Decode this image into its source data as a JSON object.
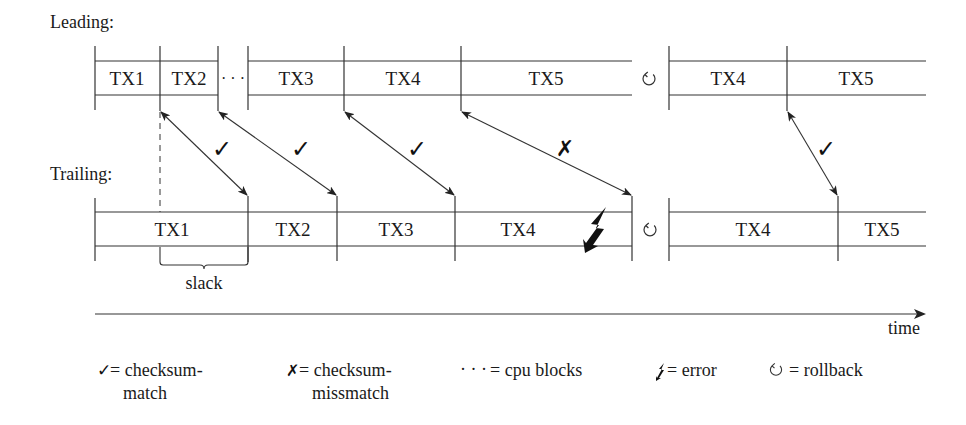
{
  "labels": {
    "leading": "Leading:",
    "trailing": "Trailing:",
    "slack": "slack",
    "time": "time",
    "cpu_blocks_dots": "· · ·"
  },
  "leading": {
    "segments": [
      {
        "label": "TX1",
        "x0": 95,
        "x1": 160
      },
      {
        "label": "TX2",
        "x0": 160,
        "x1": 218
      },
      {
        "label": "TX3",
        "x0": 248,
        "x1": 344
      },
      {
        "label": "TX4",
        "x0": 344,
        "x1": 461
      },
      {
        "label": "TX5",
        "x0": 461,
        "x1": 632
      },
      {
        "label": "TX4",
        "x0": 669,
        "x1": 787
      },
      {
        "label": "TX5",
        "x0": 787,
        "x1": 926
      }
    ]
  },
  "trailing": {
    "segments": [
      {
        "label": "TX1",
        "x0": 95,
        "x1": 248
      },
      {
        "label": "TX2",
        "x0": 248,
        "x1": 337
      },
      {
        "label": "TX3",
        "x0": 337,
        "x1": 455
      },
      {
        "label": "TX4",
        "x0": 455,
        "x1": 632
      },
      {
        "label": "TX4",
        "x0": 669,
        "x1": 838
      },
      {
        "label": "TX5",
        "x0": 838,
        "x1": 926
      }
    ]
  },
  "comparisons": [
    {
      "from": "Leading TX1 end",
      "to": "Trailing TX1 end",
      "result": "checksum-match",
      "mark": "✓"
    },
    {
      "from": "Leading TX2 end",
      "to": "Trailing TX2 end",
      "result": "checksum-match",
      "mark": "✓"
    },
    {
      "from": "Leading TX3 end",
      "to": "Trailing TX3 end",
      "result": "checksum-match",
      "mark": "✓"
    },
    {
      "from": "Leading TX4 end",
      "to": "Trailing TX4 end",
      "result": "checksum-missmatch",
      "mark": "✗"
    },
    {
      "from": "Leading TX4 end (retry)",
      "to": "Trailing TX4 end (retry)",
      "result": "checksum-match",
      "mark": "✓"
    }
  ],
  "symbols": {
    "check": "✓",
    "cross": "✗",
    "rollback": "↻",
    "error": "ϟ"
  },
  "legend": [
    {
      "symbol": "✓",
      "line1": "= checksum-",
      "line2": "match"
    },
    {
      "symbol": "✗",
      "line1": "= checksum-",
      "line2": "missmatch"
    },
    {
      "symbol": "· · ·",
      "line1": "= cpu blocks",
      "line2": ""
    },
    {
      "symbol": "ϟ",
      "line1": "= error",
      "line2": ""
    },
    {
      "symbol": "↻",
      "line1": "= rollback",
      "line2": ""
    }
  ]
}
